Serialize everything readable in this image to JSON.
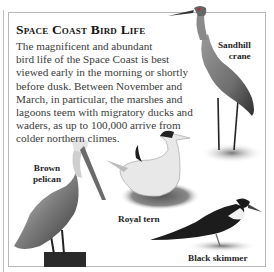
{
  "panel": {
    "title": "Space Coast Bird Life",
    "body_lines": [
      "The magnificent and abundant",
      "bird life of the Space Coast is best",
      "viewed early in the morning or shortly",
      "before dusk. Between November and",
      "March, in particular, the marshes and",
      "lagoons teem with migratory ducks and",
      "waders, as up to 100,000 arrive from",
      "colder northern climes."
    ]
  },
  "birds": [
    {
      "name": "sandhill-crane",
      "label_lines": [
        "Sandhill",
        "crane"
      ]
    },
    {
      "name": "brown-pelican",
      "label_lines": [
        "Brown",
        "pelican"
      ]
    },
    {
      "name": "royal-tern",
      "label_lines": [
        "Royal tern"
      ]
    },
    {
      "name": "black-skimmer",
      "label_lines": [
        "Black skimmer"
      ]
    }
  ],
  "colors": {
    "border": "#b8b8b8",
    "title": "#151515",
    "text": "#3a3a3a"
  }
}
